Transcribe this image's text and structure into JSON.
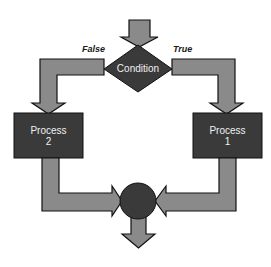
{
  "diagram": {
    "type": "flowchart",
    "colors": {
      "arrow_fill": "#8a8a8a",
      "arrow_stroke": "#111111",
      "node_fill": "#3a3a3a",
      "node_text": "#f0f0f0",
      "label_text": "#1a1a1a"
    },
    "decision": {
      "label": "Condition"
    },
    "branches": {
      "false_label": "False",
      "true_label": "True"
    },
    "process_left": {
      "line1": "Process",
      "line2": "2"
    },
    "process_right": {
      "line1": "Process",
      "line2": "1"
    },
    "merge": {
      "shape": "circle"
    }
  }
}
